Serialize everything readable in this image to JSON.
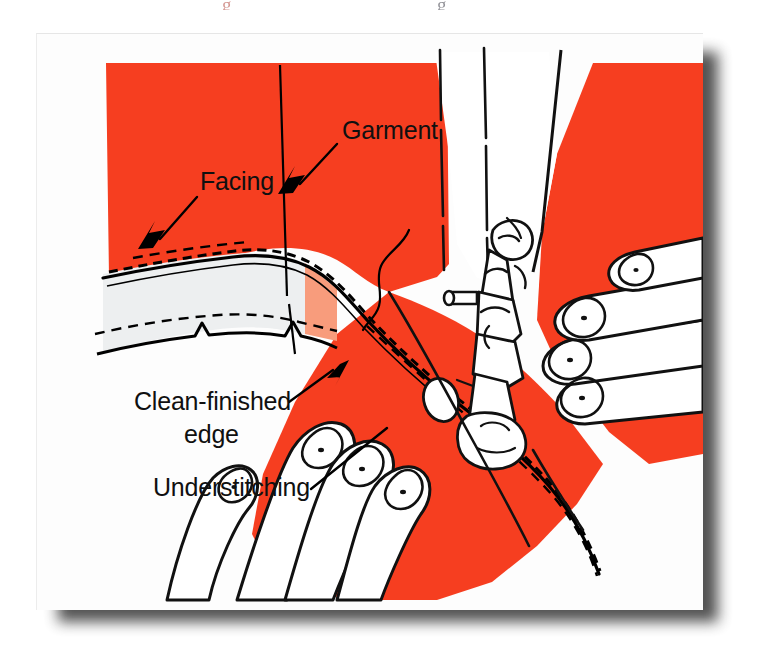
{
  "figure": {
    "top_clipped_text_left": "g",
    "top_clipped_text_right": "g",
    "labels": [
      {
        "id": "garment",
        "text": "Garment",
        "x": 305,
        "y": 105
      },
      {
        "id": "facing",
        "text": "Facing",
        "x": 163,
        "y": 156
      },
      {
        "id": "clean_finished",
        "text": "Clean-finished",
        "x": 97,
        "y": 376
      },
      {
        "id": "edge",
        "text": "edge",
        "x": 147,
        "y": 409
      },
      {
        "id": "understitching",
        "text": "Understitching",
        "x": 116,
        "y": 462
      }
    ],
    "colors": {
      "fabric_red": "#F63E20",
      "facing_light": "#F89C7C",
      "facing_white": "#EDEFF0",
      "ink": "#000000",
      "card": "#FDFDFD",
      "page": "#FFFFFF",
      "shadow": "#4A4A4A"
    },
    "elements": [
      "garment-fabric",
      "facing-underside",
      "clean-finished-edge",
      "understitching-row",
      "seam-stitch-line",
      "sewing-machine-head",
      "presser-foot",
      "needle-and-thread",
      "loose-thread",
      "left-hand",
      "right-hand"
    ]
  }
}
